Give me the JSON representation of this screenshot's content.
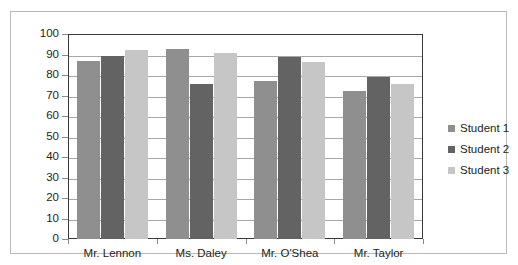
{
  "chart_data": {
    "type": "bar",
    "title": "",
    "xlabel": "",
    "ylabel": "",
    "categories": [
      "Mr. Lennon",
      "Ms. Daley",
      "Mr. O'Shea",
      "Mr. Taylor"
    ],
    "series": [
      {
        "name": "Student 1",
        "color": "#8f8f8f",
        "values": [
          87,
          92.5,
          77,
          72
        ]
      },
      {
        "name": "Student 2",
        "color": "#636363",
        "values": [
          89.5,
          75.5,
          89,
          79
        ]
      },
      {
        "name": "Student 3",
        "color": "#c6c6c6",
        "values": [
          92,
          90.5,
          86.5,
          75.5
        ]
      }
    ],
    "ylim": [
      0,
      100
    ],
    "y_ticks": [
      0,
      10,
      20,
      30,
      40,
      50,
      60,
      70,
      80,
      90,
      100
    ],
    "y_tick_labels": [
      "0",
      "10",
      "20",
      "30",
      "40",
      "50",
      "60",
      "70",
      "80",
      "90",
      "100"
    ],
    "grid": true,
    "legend_position": "right"
  },
  "legend": {
    "items": [
      {
        "label": "Student 1"
      },
      {
        "label": "Student 2"
      },
      {
        "label": "Student 3"
      }
    ]
  }
}
